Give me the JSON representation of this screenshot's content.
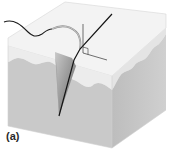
{
  "figure": {
    "panel_label": "(a)",
    "elements": [
      "tissue-block",
      "epidermis-layer",
      "dermis-layer",
      "wound-incision",
      "curved-suture-needle",
      "suture-thread",
      "right-angle-marker"
    ],
    "colors": {
      "top_face": "#f4f4f4",
      "epidermis_front": "#ebebeb",
      "dermis_front": "#c8c8c8",
      "right_face_top": "#e2e2e2",
      "right_face_dermis": "#b9b9b9",
      "incision": "#8a8a8a",
      "line": "#1a1a1a"
    }
  }
}
